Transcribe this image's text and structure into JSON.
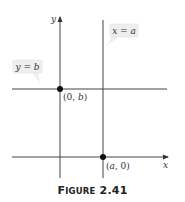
{
  "figure": {
    "caption_first_letter": "F",
    "caption_rest": "IGURE",
    "caption_number": "2.41",
    "caption_full": "FIGURE 2.41"
  },
  "axes": {
    "x_label": "x",
    "y_label": "y"
  },
  "lines": {
    "vertical": {
      "callout": "x = a",
      "callout_var": "x",
      "callout_eq": " = ",
      "callout_val": "a"
    },
    "horizontal": {
      "callout": "y = b",
      "callout_var": "y",
      "callout_eq": " = ",
      "callout_val": "b"
    }
  },
  "points": [
    {
      "label": "(0, b)",
      "open": "(0, ",
      "var": "b",
      "close": ")"
    },
    {
      "label": "(a, 0)",
      "open": "(",
      "var": "a",
      "close": ", 0)"
    }
  ],
  "colors": {
    "line": "#444444",
    "callout_fill": "#eeeeee",
    "callout_border": "#dddddd",
    "point": "#111111"
  }
}
